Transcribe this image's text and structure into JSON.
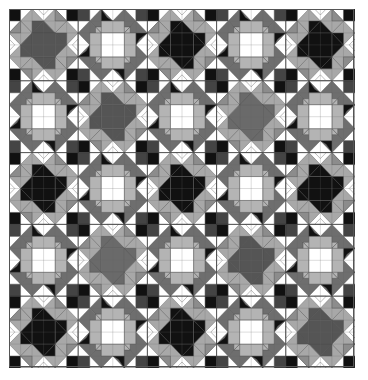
{
  "quilt": {
    "rows": 5,
    "cols": 5,
    "layout": [
      [
        "star:dark",
        "square",
        "star:black",
        "square",
        "star:black"
      ],
      [
        "square",
        "star:dark",
        "square",
        "star:mid",
        "square"
      ],
      [
        "star:black",
        "square",
        "star:black",
        "square",
        "star:black"
      ],
      [
        "square",
        "star:mid",
        "square",
        "star:dark",
        "square"
      ],
      [
        "star:black",
        "square",
        "star:black",
        "square",
        "star:dark"
      ]
    ],
    "colors": {
      "black": "#111111",
      "dark": "#555555",
      "mid": "#6a6a6a",
      "band": "#a8a8a8",
      "band_dark": "#8c8c8c",
      "light": "#b4b4b4",
      "frame": "#6e6e6e",
      "white": "#ffffff",
      "seam": "#333333",
      "corner_sq": "#444444"
    }
  }
}
